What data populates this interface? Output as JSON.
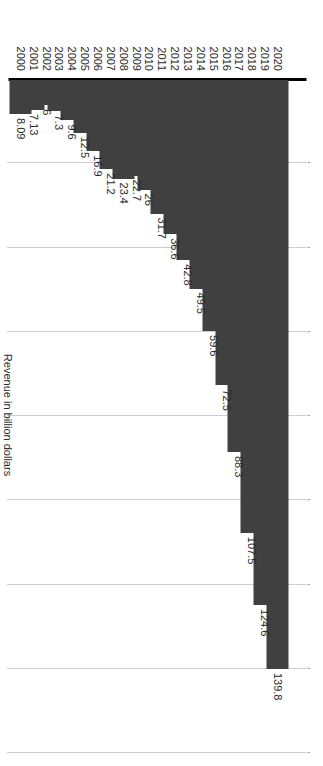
{
  "chart_data": {
    "type": "bar",
    "orientation": "horizontal",
    "title": "",
    "subtitle": "",
    "xlabel": "Revenue in billion dollars",
    "ylabel": "",
    "xlim": [
      0,
      160
    ],
    "grid": true,
    "legend": null,
    "bar_color": "#404040",
    "axis_color": "#000000",
    "gridline_color": "#9a9a9a",
    "text_color": "#2b2b2b",
    "xticks": [
      0,
      20,
      40,
      60,
      80,
      100,
      120,
      140,
      160
    ],
    "xtick_labels": [
      "0",
      "20",
      "40",
      "60",
      "80",
      "100",
      "120",
      "140",
      "160"
    ],
    "categories": [
      "2020",
      "2019",
      "2018",
      "2017",
      "2016",
      "2015",
      "2014",
      "2013",
      "2012",
      "2011",
      "2010",
      "2009",
      "2008",
      "2007",
      "2006",
      "2005",
      "2004",
      "2003",
      "2002",
      "2001",
      "2000"
    ],
    "values": [
      139.8,
      124.6,
      107.5,
      88.3,
      72.5,
      59.6,
      49.5,
      42.8,
      36.6,
      31.7,
      26,
      22.7,
      23.4,
      21.2,
      16.9,
      12.5,
      9.6,
      7.3,
      6,
      7.13,
      8.09
    ],
    "data_labels": [
      "139.8",
      "124.6",
      "107.5",
      "88.3",
      "72.5",
      "59.6",
      "49.5",
      "42.8",
      "36.6",
      "31.7",
      "26",
      "22.7",
      "23.4",
      "21.2",
      "16.9",
      "12.5",
      "9.6",
      "7.3",
      "6",
      "7.13",
      "8.09"
    ]
  }
}
